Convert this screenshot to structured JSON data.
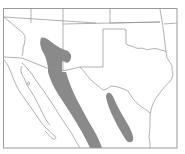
{
  "map": {
    "type": "species-range-map",
    "region": "Southwestern United States and northern Mexico",
    "colors": {
      "background": "#ffffff",
      "range_fill": "#8a8a8a",
      "borders": "#8f8f8f",
      "frame": "#9a9a9a"
    },
    "ranges": [
      {
        "name": "western-range",
        "description": "Band from central Arizona/SW New Mexico southeast through Sonora/Chihuahua"
      },
      {
        "name": "eastern-range",
        "description": "Elongated patch in Coahuila / Nuevo León, south of Texas"
      }
    ],
    "labels": []
  }
}
